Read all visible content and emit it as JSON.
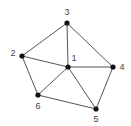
{
  "graph": {
    "nodes": [
      {
        "id": "1",
        "label": "1"
      },
      {
        "id": "2",
        "label": "2"
      },
      {
        "id": "3",
        "label": "3"
      },
      {
        "id": "4",
        "label": "4"
      },
      {
        "id": "5",
        "label": "5"
      },
      {
        "id": "6",
        "label": "6"
      }
    ],
    "edges": [
      [
        "3",
        "2"
      ],
      [
        "3",
        "1"
      ],
      [
        "3",
        "4"
      ],
      [
        "2",
        "1"
      ],
      [
        "2",
        "6"
      ],
      [
        "1",
        "4"
      ],
      [
        "1",
        "6"
      ],
      [
        "1",
        "5"
      ],
      [
        "4",
        "5"
      ],
      [
        "6",
        "5"
      ]
    ],
    "colors": {
      "edge": "#555555",
      "node": "#111111",
      "label": "#444444"
    }
  }
}
